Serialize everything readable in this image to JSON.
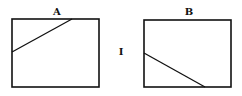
{
  "diagram": {
    "panels": [
      {
        "id": "A",
        "label": "A",
        "label_pos": [
          57,
          12
        ],
        "box": {
          "x": 12,
          "y": 19,
          "w": 87,
          "h": 68
        },
        "line": {
          "x1": 12,
          "y1": 52,
          "x2": 72,
          "y2": 19
        }
      },
      {
        "id": "B",
        "label": "B",
        "label_pos": [
          189,
          12
        ],
        "box": {
          "x": 144,
          "y": 20,
          "w": 87,
          "h": 67
        },
        "line": {
          "x1": 144,
          "y1": 53,
          "x2": 205,
          "y2": 87
        }
      }
    ],
    "center_mark": {
      "text": "I",
      "pos": [
        121,
        52
      ]
    },
    "stroke_color": "#111111"
  }
}
